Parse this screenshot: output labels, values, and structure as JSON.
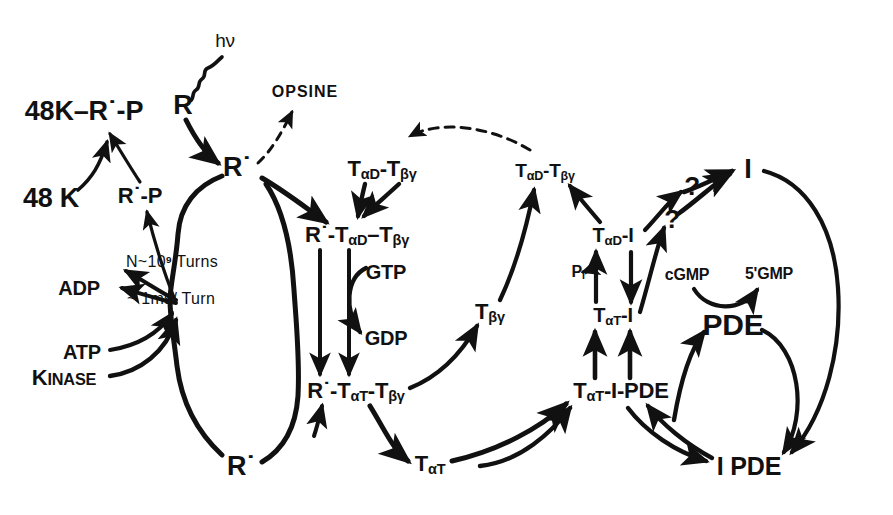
{
  "figure": {
    "background_color": "#ffffff",
    "ink_color": "#111111",
    "width": 893,
    "height": 515
  },
  "labels": {
    "hv": "hν",
    "r": "R",
    "r_star": "R˙",
    "opsine": "OPSINE",
    "r_star_p": "R˙-P",
    "k48_r_star_p": "48K–R˙-P",
    "k48": "48 K",
    "adp": "ADP",
    "atp": "ATP",
    "kinase_k": "K",
    "kinase_rest": "INASE",
    "turns_n": "N~10",
    "turns_exp": "9",
    "turns_word": " Turns",
    "ms_per_turn": "~ 1ms/ Turn",
    "tad_tbg_left": "Tα",
    "gtp": "GTP",
    "gdp": "GDP",
    "tbg": "Tβγ",
    "tat": "Tα",
    "pi": "P",
    "pi_sub": "I",
    "i": "I",
    "cgmp": "cGMP",
    "gmp5": "5'GMP",
    "pde": "PDE",
    "i_pde": "I PDE",
    "question": "?"
  },
  "nodes": [
    {
      "id": "hv",
      "text": "hν",
      "x": 225,
      "y": 40,
      "size": 19,
      "weight": "normal"
    },
    {
      "id": "r",
      "text": "R",
      "x": 183,
      "y": 105,
      "size": 27
    },
    {
      "id": "opsine",
      "text": "OPSINE",
      "x": 305,
      "y": 92,
      "size": 16
    },
    {
      "id": "k48-r-star-p",
      "text": "48K–R˙-P",
      "x": 84,
      "y": 111,
      "size": 27
    },
    {
      "id": "r-star-top",
      "text": "R˙",
      "x": 237,
      "y": 167,
      "size": 27
    },
    {
      "id": "k48",
      "text": "48 K",
      "x": 51,
      "y": 198,
      "size": 27
    },
    {
      "id": "r-star-p",
      "text": "R˙-P",
      "x": 140,
      "y": 196,
      "size": 22
    },
    {
      "id": "tad-tbg-mid",
      "text": "TαD-Tβγ",
      "x": 382,
      "y": 170,
      "size": 22
    },
    {
      "id": "tad-tbg-right",
      "text": "TαD-Tβγ",
      "x": 545,
      "y": 172,
      "size": 19
    },
    {
      "id": "i",
      "text": "I",
      "x": 748,
      "y": 169,
      "size": 27
    },
    {
      "id": "r-tad-tbg",
      "text": "R˙-TαD–Tβγ",
      "x": 357,
      "y": 236,
      "size": 22
    },
    {
      "id": "tad-i",
      "text": "TαD-I",
      "x": 613,
      "y": 236,
      "size": 20
    },
    {
      "id": "turns",
      "text": "N~10⁹ Turns",
      "x": 172,
      "y": 262,
      "size": 16,
      "weight": "normal"
    },
    {
      "id": "gtp",
      "text": "GTP",
      "x": 386,
      "y": 272,
      "size": 20
    },
    {
      "id": "cgmp",
      "text": "cGMP",
      "x": 687,
      "y": 275,
      "size": 16
    },
    {
      "id": "gmp5",
      "text": "5'GMP",
      "x": 769,
      "y": 274,
      "size": 16
    },
    {
      "id": "pi",
      "text": "PI",
      "x": 578,
      "y": 272,
      "size": 16
    },
    {
      "id": "adp",
      "text": "ADP",
      "x": 79,
      "y": 288,
      "size": 20
    },
    {
      "id": "ms-turn",
      "text": "~ 1ms/ Turn",
      "x": 171,
      "y": 299,
      "size": 16,
      "weight": "normal"
    },
    {
      "id": "tbg",
      "text": "Tβγ",
      "x": 490,
      "y": 313,
      "size": 22
    },
    {
      "id": "tat-i",
      "text": "TαT-I",
      "x": 613,
      "y": 316,
      "size": 20
    },
    {
      "id": "pde",
      "text": "PDE",
      "x": 733,
      "y": 325,
      "size": 30
    },
    {
      "id": "gdp",
      "text": "GDP",
      "x": 386,
      "y": 338,
      "size": 20
    },
    {
      "id": "atp",
      "text": "ATP",
      "x": 82,
      "y": 352,
      "size": 20
    },
    {
      "id": "kinase",
      "text": "KINASE",
      "x": 64,
      "y": 378,
      "size": 22
    },
    {
      "id": "r-tat-tbg",
      "text": "R˙-TαT-Tβγ",
      "x": 356,
      "y": 392,
      "size": 22
    },
    {
      "id": "tat-i-pde",
      "text": "TαT-I-PDE",
      "x": 621,
      "y": 392,
      "size": 22
    },
    {
      "id": "r-star-bot",
      "text": "R˙",
      "x": 241,
      "y": 466,
      "size": 27
    },
    {
      "id": "tat",
      "text": "TαT",
      "x": 430,
      "y": 465,
      "size": 22
    },
    {
      "id": "i-pde",
      "text": "I PDE",
      "x": 749,
      "y": 466,
      "size": 25
    },
    {
      "id": "q-upper",
      "text": "?",
      "x": 692,
      "y": 186,
      "size": 26
    },
    {
      "id": "q-lower",
      "text": "?",
      "x": 672,
      "y": 219,
      "size": 26
    }
  ]
}
